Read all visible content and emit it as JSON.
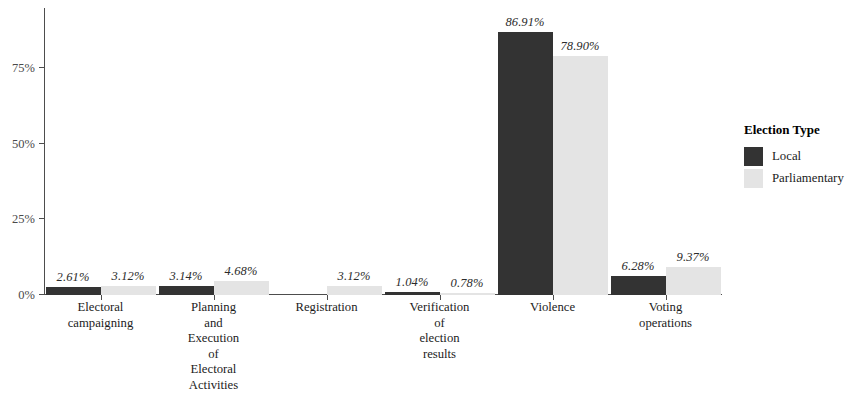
{
  "chart_data": {
    "type": "bar",
    "title": "",
    "subtitle": "",
    "xlabel": "",
    "ylabel": "",
    "grid": false,
    "orientation": "vertical",
    "grouping": "dodged",
    "categories": [
      "Electoral\ncampaigning",
      "Planning\nand\nExecution\nof\nElectoral\nActivities",
      "Registration",
      "Verification\nof\nelection\nresults",
      "Violence",
      "Voting\noperations"
    ],
    "category_lines": [
      [
        "Electoral",
        "campaigning"
      ],
      [
        "Planning",
        "and",
        "Execution",
        "of",
        "Electoral",
        "Activities"
      ],
      [
        "Registration"
      ],
      [
        "Verification",
        "of",
        "election",
        "results"
      ],
      [
        "Violence"
      ],
      [
        "Voting",
        "operations"
      ]
    ],
    "series": [
      {
        "name": "Local",
        "color": "#333333",
        "values": [
          2.61,
          3.14,
          null,
          1.04,
          86.91,
          6.28
        ],
        "labels": [
          "2.61%",
          "3.14%",
          "",
          "1.04%",
          "86.91%",
          "6.28%"
        ]
      },
      {
        "name": "Parliamentary",
        "color": "#e4e4e4",
        "values": [
          3.12,
          4.68,
          3.12,
          0.78,
          78.9,
          9.37
        ],
        "labels": [
          "3.12%",
          "4.68%",
          "3.12%",
          "0.78%",
          "78.90%",
          "9.37%"
        ]
      }
    ],
    "ylim": [
      0,
      92
    ],
    "yticks": [
      0,
      25,
      50,
      75
    ],
    "ytick_labels": [
      "0%",
      "25%",
      "50%",
      "75%"
    ],
    "legend": {
      "title": "Election Type",
      "position": "right",
      "entries": [
        {
          "label": "Local",
          "color": "#333333"
        },
        {
          "label": "Parliamentary",
          "color": "#e4e4e4"
        }
      ]
    }
  }
}
